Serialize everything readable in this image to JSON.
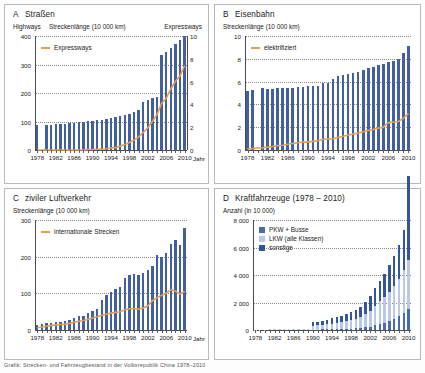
{
  "figure": {
    "caption": "Grafik: Strecken- und Fahrzeugbestand in der Volksrepublik China 1978–2010",
    "accent_orange": "#e0a152",
    "bar_blue": "#42609f",
    "jahr_label": "Jahr"
  },
  "panels": {
    "A": {
      "letter": "A",
      "title": "Straßen",
      "sub_left": "Highways",
      "sub_center": "Streckenlänge (10 000 km)",
      "sub_right": "Expressways",
      "legend": [
        "Expressways"
      ],
      "chart_data": {
        "type": "bar",
        "title": "A  Straßen",
        "xlabel": "Jahr",
        "ylabel": "Streckenlänge (10 000 km)",
        "ylabel_right": "Expressways",
        "ylim": [
          0,
          400
        ],
        "yticks": [
          0,
          100,
          200,
          300,
          400
        ],
        "ylim_right": [
          0,
          10
        ],
        "yticks_right": [
          0,
          2,
          4,
          6,
          8,
          10
        ],
        "grid": true,
        "legend_position": "top-left",
        "x": [
          1978,
          1979,
          1980,
          1981,
          1982,
          1983,
          1984,
          1985,
          1986,
          1987,
          1988,
          1989,
          1990,
          1991,
          1992,
          1993,
          1994,
          1995,
          1996,
          1997,
          1998,
          1999,
          2000,
          2001,
          2002,
          2003,
          2004,
          2005,
          2006,
          2007,
          2008,
          2009,
          2010
        ],
        "xticks": [
          1978,
          1982,
          1986,
          1990,
          1994,
          1998,
          2002,
          2006,
          2010
        ],
        "series": [
          {
            "name": "Highways",
            "type": "bar",
            "axis": "left",
            "values": [
              89,
              null,
              88,
              89,
              90,
              92,
              93,
              94,
              96,
              98,
              100,
              101,
              103,
              104,
              105,
              108,
              112,
              115,
              118,
              122,
              127,
              135,
              140,
              169,
              176,
              181,
              187,
              334,
              345,
              358,
              373,
              386,
              401
            ]
          },
          {
            "name": "Expressways",
            "type": "line",
            "axis": "right",
            "values": [
              0,
              0,
              0,
              0,
              0,
              0,
              0,
              0,
              0,
              0,
              0.01,
              0.03,
              0.05,
              0.06,
              0.07,
              0.11,
              0.17,
              0.21,
              0.34,
              0.48,
              0.66,
              0.87,
              1.16,
              1.54,
              1.95,
              2.51,
              3.13,
              4.1,
              4.53,
              5.39,
              6.03,
              6.51,
              7.41
            ]
          }
        ]
      }
    },
    "B": {
      "letter": "B",
      "title": "Eisenbahn",
      "sub_left": "Streckenlänge (10 000 km)",
      "legend": [
        "elektrifiziert"
      ],
      "chart_data": {
        "type": "bar",
        "title": "B  Eisenbahn",
        "xlabel": "Jahr",
        "ylabel": "Streckenlänge (10 000 km)",
        "ylim": [
          0,
          10
        ],
        "yticks": [
          0,
          2,
          4,
          6,
          8,
          10
        ],
        "grid": true,
        "legend_position": "top-left",
        "x": [
          1978,
          1979,
          1980,
          1981,
          1982,
          1983,
          1984,
          1985,
          1986,
          1987,
          1988,
          1989,
          1990,
          1991,
          1992,
          1993,
          1994,
          1995,
          1996,
          1997,
          1998,
          1999,
          2000,
          2001,
          2002,
          2003,
          2004,
          2005,
          2006,
          2007,
          2008,
          2009,
          2010
        ],
        "xticks": [
          1978,
          1982,
          1986,
          1990,
          1994,
          1998,
          2002,
          2006,
          2010
        ],
        "series": [
          {
            "name": "Streckenlänge",
            "type": "bar",
            "values": [
              5.17,
              5.3,
              null,
              5.4,
              5.35,
              5.38,
              5.4,
              5.45,
              5.47,
              5.48,
              5.51,
              5.53,
              5.58,
              5.62,
              5.65,
              5.86,
              5.9,
              6.24,
              6.49,
              6.6,
              6.64,
              6.74,
              6.87,
              7.01,
              7.19,
              7.3,
              7.44,
              7.54,
              7.71,
              7.8,
              7.97,
              8.55,
              9.12
            ]
          },
          {
            "name": "elektrifiziert",
            "type": "line",
            "values": [
              0.1,
              0.12,
              0.17,
              0.2,
              0.25,
              0.31,
              0.38,
              0.41,
              0.5,
              0.58,
              0.63,
              0.7,
              0.69,
              0.76,
              0.83,
              0.92,
              0.98,
              1.0,
              1.1,
              1.2,
              1.3,
              1.4,
              1.49,
              1.6,
              1.72,
              1.8,
              1.92,
              2.0,
              2.4,
              2.45,
              2.5,
              2.8,
              3.2
            ]
          }
        ]
      }
    },
    "C": {
      "letter": "C",
      "title": "ziviler Luftverkehr",
      "sub_left": "Streckenlänge (10 000 km)",
      "legend": [
        "internationale Strecken"
      ],
      "chart_data": {
        "type": "bar",
        "title": "C  ziviler Luftverkehr",
        "xlabel": "Jahr",
        "ylabel": "Streckenlänge (10 000 km)",
        "ylim": [
          0,
          300
        ],
        "yticks": [
          0,
          100,
          200,
          300
        ],
        "grid": true,
        "legend_position": "top-left",
        "x": [
          1978,
          1979,
          1980,
          1981,
          1982,
          1983,
          1984,
          1985,
          1986,
          1987,
          1988,
          1989,
          1990,
          1991,
          1992,
          1993,
          1994,
          1995,
          1996,
          1997,
          1998,
          1999,
          2000,
          2001,
          2002,
          2003,
          2004,
          2005,
          2006,
          2007,
          2008,
          2009,
          2010
        ],
        "xticks": [
          1978,
          1982,
          1986,
          1990,
          1994,
          1998,
          2002,
          2006,
          2010
        ],
        "series": [
          {
            "name": "Streckenlänge",
            "type": "bar",
            "values": [
              14,
              16,
              19,
              20,
              23,
              22,
              24,
              27,
              32,
              38,
              37,
              47,
              51,
              56,
              83,
              96,
              104,
              113,
              117,
              142,
              151,
              152,
              150,
              155,
              163,
              175,
              205,
              200,
              211,
              234,
              246,
              232,
              277
            ]
          },
          {
            "name": "internationale Strecken",
            "type": "line",
            "values": [
              6,
              8,
              10,
              12,
              14,
              15,
              16,
              18,
              21,
              24,
              26,
              29,
              33,
              36,
              40,
              43,
              46,
              48,
              50,
              55,
              58,
              58,
              57,
              60,
              66,
              80,
              88,
              95,
              100,
              110,
              106,
              98,
              105
            ]
          }
        ]
      }
    },
    "D": {
      "letter": "D",
      "title": "Kraftfahrzeuge (1978 – 2010)",
      "sub_left": "Anzahl (in 10 000)",
      "legend": [
        "PKW + Busse",
        "LKW (alle Klassen)",
        "sonstige"
      ],
      "legend_colors": [
        "#4a6aad",
        "#b9c8e4",
        "#33559b"
      ],
      "chart_data": {
        "type": "bar",
        "stacked": true,
        "title": "D  Kraftfahrzeuge (1978 – 2010)",
        "xlabel": "Jahr",
        "ylabel": "Anzahl (in 10 000)",
        "ylim": [
          0,
          8000
        ],
        "yticks": [
          0,
          2000,
          4000,
          6000,
          8000
        ],
        "ytick_labels": [
          "0",
          "2 000",
          "4 000",
          "6 000",
          "8 000"
        ],
        "grid": true,
        "legend_position": "top-left",
        "x": [
          1978,
          1979,
          1980,
          1981,
          1982,
          1983,
          1984,
          1985,
          1986,
          1987,
          1988,
          1989,
          1990,
          1991,
          1992,
          1993,
          1994,
          1995,
          1996,
          1997,
          1998,
          1999,
          2000,
          2001,
          2002,
          2003,
          2004,
          2005,
          2006,
          2007,
          2008,
          2009,
          2010
        ],
        "xticks": [
          1978,
          1982,
          1986,
          1990,
          1994,
          1998,
          2002,
          2006,
          2010
        ],
        "series": [
          {
            "name": "PKW + Busse",
            "color": "#4a6aad",
            "values": [
              0,
              0,
              0,
              0,
              0,
              0,
              0,
              0,
              0,
              0,
              0,
              0,
              30,
              34,
              38,
              45,
              53,
              62,
              72,
              85,
              100,
              120,
              150,
              190,
              250,
              330,
              430,
              520,
              650,
              800,
              1000,
              1250,
              1500
            ]
          },
          {
            "name": "LKW (alle Klassen)",
            "color": "#b9c8e4",
            "values": [
              29,
              32,
              35,
              38,
              42,
              46,
              52,
              60,
              68,
              76,
              86,
              96,
              280,
              300,
              330,
              370,
              410,
              450,
              500,
              560,
              620,
              700,
              800,
              950,
              1150,
              1420,
              1650,
              1850,
              2120,
              2400,
              2700,
              3100,
              3600
            ]
          },
          {
            "name": "sonstige",
            "color": "#33559b",
            "values": [
              0,
              0,
              0,
              0,
              0,
              0,
              0,
              0,
              0,
              0,
              0,
              0,
              250,
              270,
              300,
              340,
              380,
              420,
              460,
              520,
              580,
              650,
              740,
              880,
              1050,
              1280,
              1500,
              1700,
              1950,
              2200,
              2500,
              2900,
              6100
            ]
          }
        ]
      }
    }
  }
}
